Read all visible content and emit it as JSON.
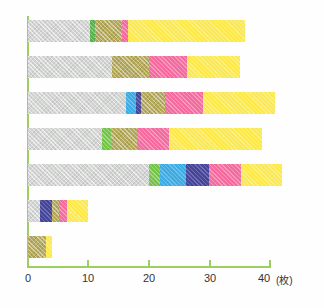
{
  "chart_data": {
    "type": "bar",
    "orientation": "horizontal",
    "stacked": true,
    "title": "",
    "subtitle": "",
    "xlabel": "(枚)",
    "ylabel": "",
    "xlim": [
      0,
      40
    ],
    "xticks": [
      0,
      10,
      20,
      30,
      40
    ],
    "xtick_labels": [
      "0",
      "10",
      "20",
      "30",
      "40"
    ],
    "unit_label": "(枚)",
    "grid": false,
    "legend": "none",
    "categories": [
      "1",
      "2",
      "3",
      "4",
      "5",
      "6",
      "7"
    ],
    "series": [
      {
        "name": "gray",
        "color": "#d4d6d4",
        "values": [
          10.3,
          13.9,
          16.2,
          12.2,
          20.0,
          2.0,
          0.0
        ]
      },
      {
        "name": "green",
        "color": "#58b14c",
        "values": [
          0.7,
          0.0,
          0.0,
          1.5,
          1.8,
          0.0,
          0.0
        ]
      },
      {
        "name": "blue",
        "color": "#3bace4",
        "values": [
          0.0,
          0.0,
          1.7,
          0.0,
          4.3,
          0.0,
          0.0
        ]
      },
      {
        "name": "navy",
        "color": "#45459a",
        "values": [
          0.0,
          0.0,
          0.7,
          0.0,
          3.8,
          2.0,
          0.0
        ]
      },
      {
        "name": "olive",
        "color": "#b7ab5e",
        "values": [
          4.6,
          6.1,
          4.1,
          4.3,
          0.0,
          1.2,
          3.0
        ]
      },
      {
        "name": "pink",
        "color": "#f46ba0",
        "values": [
          1.0,
          6.3,
          6.3,
          5.3,
          5.3,
          1.2,
          0.0
        ]
      },
      {
        "name": "yellow",
        "color": "#fbe94f",
        "values": [
          19.3,
          8.7,
          11.9,
          15.4,
          6.8,
          3.5,
          1.0
        ]
      }
    ],
    "totals": [
      35.9,
      35.0,
      40.9,
      38.7,
      42.0,
      9.9,
      4.0
    ]
  },
  "axis": {
    "unit": "(枚)",
    "tick0": "0",
    "tick1": "10",
    "tick2": "20",
    "tick3": "30",
    "tick4": "40"
  },
  "colors": {
    "axis": "#9ccf5d",
    "gray": "#d4d6d4",
    "green": "#58b14c",
    "light_green": "#74c44a",
    "blue": "#3bace4",
    "navy": "#45459a",
    "olive": "#b7ab5e",
    "pink": "#f46ba0",
    "yellow": "#fbe94f"
  }
}
